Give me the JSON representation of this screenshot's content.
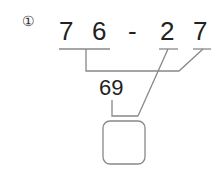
{
  "problem": {
    "number": "①",
    "digits": [
      "7",
      "6",
      "-",
      "2",
      "7"
    ],
    "intermediate": "69",
    "answer_box": ""
  },
  "colors": {
    "line": "#888888",
    "text": "#222222"
  }
}
